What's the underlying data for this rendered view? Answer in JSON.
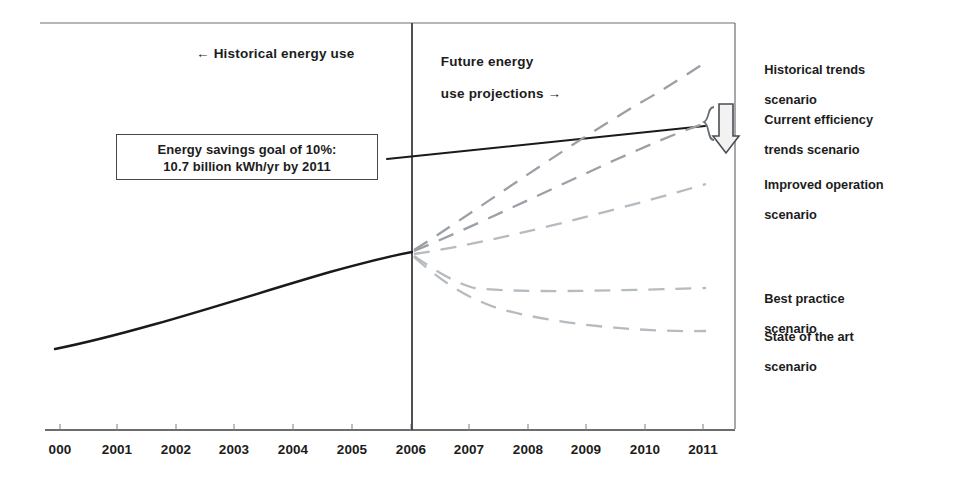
{
  "chart_data": {
    "type": "line",
    "title": "",
    "subtitle": "",
    "xlabel": "",
    "ylabel": "",
    "grid": false,
    "legend_position": "right-inline-labels",
    "xlim": [
      2000,
      2011
    ],
    "x_tick_labels": [
      "000",
      "2001",
      "2002",
      "2003",
      "2004",
      "2005",
      "2006",
      "2007",
      "2008",
      "2009",
      "2010",
      "2011"
    ],
    "x": [
      2000,
      2001,
      2002,
      2003,
      2004,
      2005,
      2006,
      2007,
      2008,
      2009,
      2010,
      2011
    ],
    "divider_year": 2006,
    "period_labels": {
      "historical": "← Historical energy use",
      "future_line1": "Future energy",
      "future_line2": "use projections →"
    },
    "annotation": {
      "line1": "Energy savings goal of 10%:",
      "line2": "10.7 billion kWh/yr by 2011"
    },
    "series": [
      {
        "name": "Historical energy use",
        "style": "solid",
        "color": "#1a1a1a",
        "values": [
          10.0,
          10.5,
          11.0,
          11.6,
          12.2,
          12.9,
          13.6,
          null,
          null,
          null,
          null,
          null
        ]
      },
      {
        "name": "Energy savings goal",
        "style": "solid",
        "color": "#1a1a1a",
        "values": [
          null,
          null,
          null,
          null,
          null,
          null,
          16.4,
          16.7,
          17.0,
          17.3,
          17.6,
          17.9
        ]
      },
      {
        "name": "Historical trends scenario",
        "style": "dashed",
        "color": "#9aa0a6",
        "values": [
          null,
          null,
          null,
          null,
          null,
          null,
          13.6,
          15.1,
          16.8,
          18.6,
          20.6,
          22.8
        ]
      },
      {
        "name": "Current efficiency trends scenario",
        "style": "dashed",
        "color": "#9aa0a6",
        "values": [
          null,
          null,
          null,
          null,
          null,
          null,
          13.6,
          14.4,
          15.3,
          16.2,
          17.1,
          17.9
        ]
      },
      {
        "name": "Improved operation scenario",
        "style": "dashed",
        "color": "#b6bbc0",
        "values": [
          null,
          null,
          null,
          null,
          null,
          null,
          13.6,
          13.9,
          14.3,
          14.8,
          15.3,
          15.9
        ]
      },
      {
        "name": "Best practice scenario",
        "style": "dashed",
        "color": "#b6bbc0",
        "values": [
          null,
          null,
          null,
          null,
          null,
          null,
          13.6,
          12.5,
          12.2,
          12.2,
          12.2,
          12.2
        ]
      },
      {
        "name": "State of the art scenario",
        "style": "dashed",
        "color": "#b6bbc0",
        "values": [
          null,
          null,
          null,
          null,
          null,
          null,
          13.6,
          12.2,
          11.4,
          10.9,
          10.6,
          10.4
        ]
      }
    ],
    "scenario_labels": [
      {
        "line1": "Historical trends",
        "line2": "scenario"
      },
      {
        "line1": "Current efficiency",
        "line2": "trends scenario"
      },
      {
        "line1": "Improved operation",
        "line2": "scenario"
      },
      {
        "line1": "Best practice",
        "line2": "scenario"
      },
      {
        "line1": "State of the art",
        "line2": "scenario"
      }
    ],
    "marker": {
      "name": "savings-gap-arrow",
      "glyph": "down-arrow-with-brace",
      "color": "#55595e"
    }
  },
  "axis": {
    "ticks": [
      {
        "label": "000",
        "x": 60
      },
      {
        "label": "2001",
        "x": 117
      },
      {
        "label": "2002",
        "x": 176
      },
      {
        "label": "2003",
        "x": 234
      },
      {
        "label": "2004",
        "x": 293
      },
      {
        "label": "2005",
        "x": 352
      },
      {
        "label": "2006",
        "x": 411
      },
      {
        "label": "2007",
        "x": 469
      },
      {
        "label": "2008",
        "x": 528
      },
      {
        "label": "2009",
        "x": 586
      },
      {
        "label": "2010",
        "x": 645
      },
      {
        "label": "2011",
        "x": 703
      }
    ]
  },
  "colors": {
    "ink": "#1c1c1c",
    "frame": "#55595e",
    "solid_line": "#1a1a1a",
    "dashed_dark": "#9aa0a6",
    "dashed_light": "#b6bbc0",
    "background": "#ffffff"
  }
}
